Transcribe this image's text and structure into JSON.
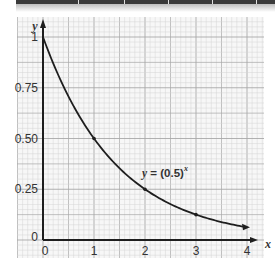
{
  "chart_data": {
    "type": "line",
    "title": "",
    "equation_label": "y = (0.5)",
    "equation_exponent": "x",
    "xlabel": "x",
    "ylabel": "y",
    "xlim": [
      0,
      4
    ],
    "ylim": [
      0,
      1
    ],
    "x_ticks": [
      "0",
      "1",
      "2",
      "3",
      "4"
    ],
    "y_ticks": [
      "0",
      "0.25",
      "0.50",
      "0.75",
      "1"
    ],
    "grid": true,
    "legend": "none",
    "series": [
      {
        "name": "y = (0.5)^x",
        "x": [
          0,
          0.5,
          1,
          1.5,
          2,
          2.5,
          3,
          3.5,
          4
        ],
        "y": [
          1,
          0.707,
          0.5,
          0.354,
          0.25,
          0.177,
          0.125,
          0.088,
          0.0625
        ]
      }
    ],
    "marked_points": [
      {
        "x": 1,
        "y": 0.5
      },
      {
        "x": 2,
        "y": 0.25
      },
      {
        "x": 3,
        "y": 0.125
      }
    ]
  },
  "colors": {
    "grid_minor": "#d4d4d4",
    "grid_major": "#a8a8a8",
    "axis": "#1e1e1e",
    "curve": "#1e1e1e"
  }
}
